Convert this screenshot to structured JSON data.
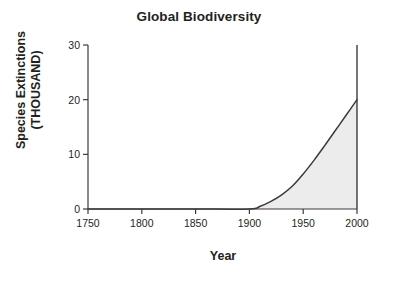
{
  "chart_data": {
    "type": "area",
    "title": "Global Biodiversity",
    "xlabel": "Year",
    "ylabel": "Species Extinctions (THOUSAND)",
    "ylabel_line1": "Species Extinctions",
    "ylabel_line2": "(THOUSAND)",
    "xlim": [
      1750,
      2000
    ],
    "ylim": [
      0,
      30
    ],
    "xticks": [
      1750,
      1800,
      1850,
      1900,
      1950,
      2000
    ],
    "xtick_labels": [
      "1750",
      "1800",
      "1850",
      "1900",
      "1950",
      "2000"
    ],
    "yticks": [
      0,
      10,
      20,
      30
    ],
    "ytick_labels": [
      "0",
      "10",
      "20",
      "30"
    ],
    "grid": false,
    "legend": "none",
    "x": [
      1750,
      1800,
      1850,
      1900,
      1910,
      1920,
      1930,
      1940,
      1950,
      1960,
      1970,
      1980,
      1990,
      2000
    ],
    "values": [
      0,
      0,
      0,
      0,
      0.5,
      1.4,
      2.6,
      4.2,
      6.4,
      8.9,
      11.6,
      14.4,
      17.2,
      20
    ],
    "series": [
      {
        "name": "Species Extinctions",
        "values": [
          0,
          0,
          0,
          0,
          0.5,
          1.4,
          2.6,
          4.2,
          6.4,
          8.9,
          11.6,
          14.4,
          17.2,
          20
        ]
      }
    ],
    "annotations": [
      "Vertical line at year 2000 rising from 0 to 30"
    ],
    "colors": {
      "line": "#3b3b3b",
      "fill": "#ececec",
      "axis": "#3b3b3b",
      "text": "#231f20",
      "background": "#ffffff"
    }
  }
}
